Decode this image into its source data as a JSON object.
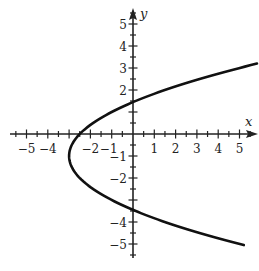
{
  "chart_data": {
    "type": "line",
    "title": "",
    "xlabel": "x",
    "ylabel": "y",
    "xlim": [
      -5.5,
      5.5
    ],
    "ylim": [
      -5.5,
      5.5
    ],
    "grid": false,
    "x_ticks": [
      -5,
      -4,
      -3,
      -2,
      -1,
      1,
      2,
      3,
      4,
      5
    ],
    "x_tick_labels": [
      "−5",
      "−4",
      "",
      "−2",
      "−1",
      "1",
      "2",
      "3",
      "4",
      "5"
    ],
    "y_ticks": [
      -5,
      -4,
      -3,
      -2,
      -1,
      1,
      2,
      3,
      4,
      5
    ],
    "y_tick_labels": [
      "−5",
      "−4",
      "",
      "−2",
      "−1",
      "",
      "2",
      "3",
      "4",
      "5"
    ],
    "minor_tick_step": 0.5,
    "series": [
      {
        "name": "parabola x = 0.5(y+1)^2 - 3",
        "equation": "x = 0.5*(y+1)^2 - 3",
        "vertex": [
          -3,
          -1
        ],
        "x_intercept": -2.5,
        "y_intercepts": [
          1.45,
          -3.45
        ],
        "y_range": [
          -5.05,
          3.2
        ],
        "points": [
          [
            5.05,
            -5.05
          ],
          [
            3.0,
            -4.46
          ],
          [
            1.0,
            -3.83
          ],
          [
            0.0,
            -3.45
          ],
          [
            -1.0,
            -3.0
          ],
          [
            -2.0,
            -2.41
          ],
          [
            -3.0,
            -1.0
          ],
          [
            -2.0,
            0.41
          ],
          [
            -1.0,
            1.0
          ],
          [
            0.0,
            1.45
          ],
          [
            1.0,
            1.83
          ],
          [
            2.0,
            2.16
          ],
          [
            3.0,
            2.46
          ],
          [
            4.0,
            2.74
          ],
          [
            5.0,
            3.0
          ],
          [
            5.6,
            3.2
          ]
        ]
      }
    ],
    "pixel_mapping": {
      "origin_px": [
        133,
        134
      ],
      "px_per_unit_x": 21.3,
      "px_per_unit_y": 22
    },
    "colors": {
      "curve": "#111111",
      "axes": "#222222",
      "background": "#ffffff"
    }
  }
}
